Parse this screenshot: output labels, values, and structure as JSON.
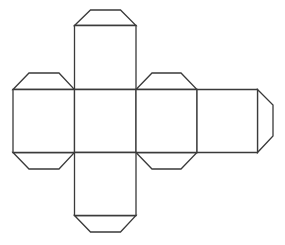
{
  "diagram": {
    "type": "cube-net",
    "stroke_color": "#3a3a3a",
    "fill_color": "#ffffff",
    "faces": [
      {
        "id": "top",
        "points": "74.5,25.5 136,25.5 136,89.5 74.5,89.5"
      },
      {
        "id": "left",
        "points": "13,89.5 74.5,89.5 74.5,152.5 13,152.5"
      },
      {
        "id": "center",
        "points": "74.5,89.5 136,89.5 136,152.5 74.5,152.5"
      },
      {
        "id": "right",
        "points": "136,89.5 197,89.5 197,152.5 136,152.5"
      },
      {
        "id": "far-right",
        "points": "197,89.5 257.5,89.5 257.5,152.5 197,152.5"
      },
      {
        "id": "bottom",
        "points": "74.5,152.5 136,152.5 136,215.5 74.5,215.5"
      }
    ],
    "tabs": [
      {
        "id": "top-tab",
        "points": "74.5,25.5 90.5,10 120.5,10 136,25.5"
      },
      {
        "id": "left-top-tab",
        "points": "13,89.5 29,73 59,73 74.5,89.5"
      },
      {
        "id": "left-bottom-tab",
        "points": "13,152.5 29,169 59,169 74.5,152.5"
      },
      {
        "id": "right-top-tab",
        "points": "136,89.5 152,73 181,73 197,89.5"
      },
      {
        "id": "right-bottom-tab",
        "points": "136,152.5 152,169 181,169 197,152.5"
      },
      {
        "id": "far-right-tab",
        "points": "257.5,89.5 273,105 273,136 257.5,152.5"
      },
      {
        "id": "bottom-tab",
        "points": "74.5,215.5 90.5,232 120.5,232 136,215.5"
      }
    ]
  }
}
